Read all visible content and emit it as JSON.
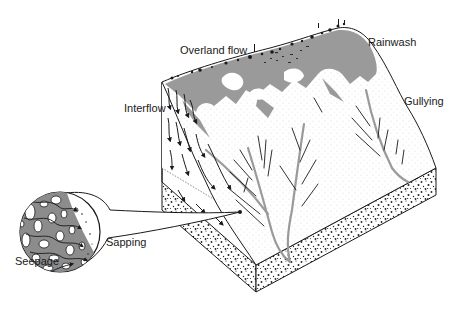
{
  "diagram": {
    "type": "block-diagram",
    "labels": {
      "overland_flow": "Overland flow",
      "rainwash": "Rainwash",
      "gullying": "Gullying",
      "interflow": "Interflow",
      "sapping": "Sapping",
      "seepage": "Seepage"
    },
    "inset": {
      "description": "magnified view of porous soil showing seepage flow paths"
    },
    "colors": {
      "ink": "#1a1a1a",
      "water_gray": "#9a9a9a",
      "soil_gray": "#8c8c8c",
      "background": "#ffffff"
    }
  }
}
